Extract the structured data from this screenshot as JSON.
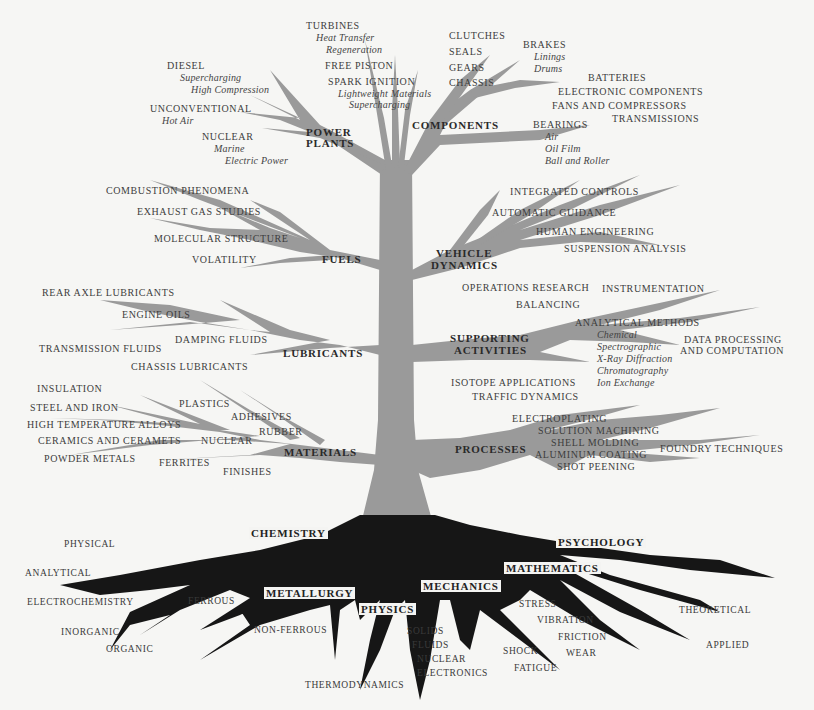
{
  "colors": {
    "background": "#f6f6f4",
    "branch": "#9a9a9a",
    "root": "#161616",
    "text": "#3d3d3d"
  },
  "branches": {
    "power_plants": {
      "label_line1": "POWER",
      "label_line2": "PLANTS",
      "items": [
        "TURBINES",
        "FREE PISTON",
        "SPARK IGNITION",
        "DIESEL",
        "UNCONVENTIONAL",
        "NUCLEAR"
      ],
      "turbines_sub": [
        "Heat Transfer",
        "Regeneration"
      ],
      "spark_sub": [
        "Lightweight Materials",
        "Supercharging"
      ],
      "diesel_sub": [
        "Supercharging",
        "High Compression"
      ],
      "unconventional_sub": [
        "Hot Air"
      ],
      "nuclear_sub": [
        "Marine",
        "Electric Power"
      ]
    },
    "components": {
      "label": "COMPONENTS",
      "items": [
        "CLUTCHES",
        "SEALS",
        "GEARS",
        "CHASSIS",
        "BRAKES",
        "BATTERIES",
        "ELECTRONIC COMPONENTS",
        "FANS AND COMPRESSORS",
        "TRANSMISSIONS",
        "BEARINGS"
      ],
      "brakes_sub": [
        "Linings",
        "Drums"
      ],
      "bearings_sub": [
        "Air",
        "Oil Film",
        "Ball and Roller"
      ]
    },
    "fuels": {
      "label": "FUELS",
      "items": [
        "COMBUSTION PHENOMENA",
        "EXHAUST GAS STUDIES",
        "MOLECULAR STRUCTURE",
        "VOLATILITY"
      ]
    },
    "vehicle_dynamics": {
      "label_line1": "VEHICLE",
      "label_line2": "DYNAMICS",
      "items": [
        "INTEGRATED CONTROLS",
        "AUTOMATIC GUIDANCE",
        "HUMAN ENGINEERING",
        "SUSPENSION ANALYSIS"
      ]
    },
    "lubricants": {
      "label": "LUBRICANTS",
      "items": [
        "REAR AXLE LUBRICANTS",
        "ENGINE OILS",
        "DAMPING FLUIDS",
        "TRANSMISSION FLUIDS",
        "CHASSIS LUBRICANTS"
      ]
    },
    "supporting_activities": {
      "label_line1": "SUPPORTING",
      "label_line2": "ACTIVITIES",
      "items": [
        "OPERATIONS RESEARCH",
        "INSTRUMENTATION",
        "BALANCING",
        "ANALYTICAL METHODS",
        "DATA PROCESSING",
        "AND COMPUTATION",
        "ISOTOPE APPLICATIONS",
        "TRAFFIC DYNAMICS"
      ],
      "analytical_sub": [
        "Chemical",
        "Spectrographic",
        "X-Ray Diffraction",
        "Chromatography",
        "Ion Exchange"
      ]
    },
    "materials": {
      "label": "MATERIALS",
      "items": [
        "INSULATION",
        "STEEL AND IRON",
        "HIGH TEMPERATURE ALLOYS",
        "CERAMICS AND CERAMETS",
        "POWDER METALS",
        "PLASTICS",
        "ADHESIVES",
        "RUBBER",
        "NUCLEAR",
        "FERRITES",
        "FINISHES"
      ]
    },
    "processes": {
      "label": "PROCESSES",
      "items": [
        "ELECTROPLATING",
        "SOLUTION MACHINING",
        "SHELL MOLDING",
        "ALUMINUM COATING",
        "SHOT PEENING",
        "FOUNDRY TECHNIQUES"
      ]
    }
  },
  "roots": {
    "chemistry": {
      "label": "CHEMISTRY",
      "items": [
        "PHYSICAL",
        "ANALYTICAL",
        "ELECTROCHEMISTRY",
        "INORGANIC",
        "ORGANIC"
      ]
    },
    "metallurgy": {
      "label": "METALLURGY",
      "items": [
        "FERROUS",
        "NON-FERROUS"
      ]
    },
    "physics": {
      "label": "PHYSICS",
      "items": [
        "THERMODYNAMICS",
        "SOLIDS",
        "FLUIDS",
        "NUCLEAR",
        "ELECTRONICS"
      ]
    },
    "mechanics": {
      "label": "MECHANICS",
      "items": [
        "STRESS",
        "VIBRATION",
        "FRICTION",
        "WEAR",
        "SHOCK",
        "FATIGUE"
      ]
    },
    "mathematics": {
      "label": "MATHEMATICS",
      "items": [
        "THEORETICAL",
        "APPLIED"
      ]
    },
    "psychology": {
      "label": "PSYCHOLOGY"
    }
  }
}
